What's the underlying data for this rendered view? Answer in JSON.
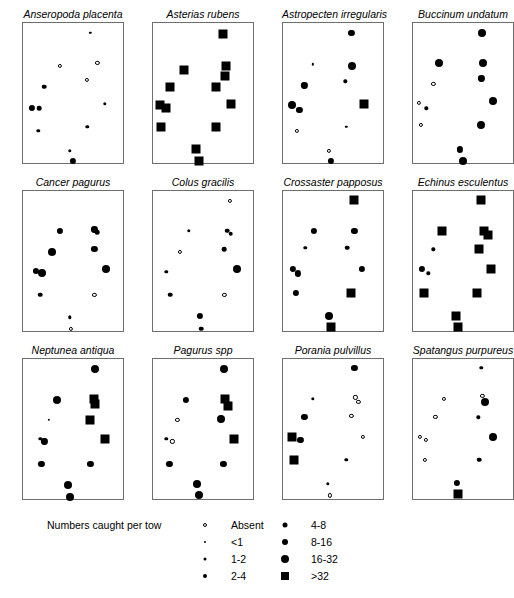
{
  "figure": {
    "island_name": "Isle of Man",
    "panel_count": 12
  },
  "legend": {
    "title": "Numbers caught per tow",
    "entries_left": [
      {
        "label": "Absent",
        "symbol": "open-circle",
        "size": 4
      },
      {
        "label": "<1",
        "symbol": "filled-circle",
        "size": 2
      },
      {
        "label": "1-2",
        "symbol": "filled-circle",
        "size": 3
      },
      {
        "label": "2-4",
        "symbol": "filled-circle",
        "size": 4
      }
    ],
    "entries_right": [
      {
        "label": "4-8",
        "symbol": "filled-circle",
        "size": 5
      },
      {
        "label": "8-16",
        "symbol": "filled-circle",
        "size": 6
      },
      {
        "label": "16-32",
        "symbol": "filled-circle",
        "size": 8
      },
      {
        "label": ">32",
        "symbol": "filled-square",
        "size": 8
      }
    ]
  },
  "chart_data": {
    "type": "scatter",
    "title": "Numbers caught per tow",
    "xlabel": "",
    "ylabel": "",
    "legend_position": "bottom",
    "grid": false,
    "note": "Twelve species distribution maps around the Isle of Man; marker size/shape encodes abundance class",
    "size_classes": [
      "Absent",
      "<1",
      "1-2",
      "2-4",
      "4-8",
      "8-16",
      "16-32",
      ">32"
    ],
    "panels": [
      {
        "title": "Anseropoda placenta",
        "row": 0,
        "col": 0,
        "points": [
          {
            "x": 0.66,
            "y": 0.07,
            "cls": "<1"
          },
          {
            "x": 0.36,
            "y": 0.3,
            "cls": "Absent"
          },
          {
            "x": 0.73,
            "y": 0.28,
            "cls": "Absent"
          },
          {
            "x": 0.63,
            "y": 0.4,
            "cls": "Absent"
          },
          {
            "x": 0.21,
            "y": 0.45,
            "cls": "2-4"
          },
          {
            "x": 0.09,
            "y": 0.6,
            "cls": "4-8"
          },
          {
            "x": 0.16,
            "y": 0.6,
            "cls": "2-4"
          },
          {
            "x": 0.8,
            "y": 0.57,
            "cls": "1-2"
          },
          {
            "x": 0.15,
            "y": 0.76,
            "cls": "1-2"
          },
          {
            "x": 0.63,
            "y": 0.73,
            "cls": "1-2"
          },
          {
            "x": 0.46,
            "y": 0.9,
            "cls": "1-2"
          },
          {
            "x": 0.49,
            "y": 0.97,
            "cls": "4-8"
          }
        ]
      },
      {
        "title": "Asterias rubens",
        "row": 0,
        "col": 1,
        "points": [
          {
            "x": 0.69,
            "y": 0.08,
            "cls": ">32"
          },
          {
            "x": 0.3,
            "y": 0.33,
            "cls": ">32"
          },
          {
            "x": 0.72,
            "y": 0.3,
            "cls": ">32"
          },
          {
            "x": 0.71,
            "y": 0.37,
            "cls": ">32"
          },
          {
            "x": 0.17,
            "y": 0.45,
            "cls": ">32"
          },
          {
            "x": 0.62,
            "y": 0.45,
            "cls": ">32"
          },
          {
            "x": 0.07,
            "y": 0.58,
            "cls": ">32"
          },
          {
            "x": 0.13,
            "y": 0.6,
            "cls": ">32"
          },
          {
            "x": 0.76,
            "y": 0.57,
            "cls": ">32"
          },
          {
            "x": 0.08,
            "y": 0.73,
            "cls": ">32"
          },
          {
            "x": 0.62,
            "y": 0.73,
            "cls": ">32"
          },
          {
            "x": 0.42,
            "y": 0.89,
            "cls": ">32"
          },
          {
            "x": 0.45,
            "y": 0.97,
            "cls": ">32"
          }
        ]
      },
      {
        "title": "Astropecten irregularis",
        "row": 0,
        "col": 2,
        "points": [
          {
            "x": 0.67,
            "y": 0.07,
            "cls": "4-8"
          },
          {
            "x": 0.29,
            "y": 0.29,
            "cls": "<1"
          },
          {
            "x": 0.68,
            "y": 0.3,
            "cls": "8-16"
          },
          {
            "x": 0.61,
            "y": 0.41,
            "cls": "1-2"
          },
          {
            "x": 0.21,
            "y": 0.44,
            "cls": "4-8"
          },
          {
            "x": 0.09,
            "y": 0.58,
            "cls": "8-16"
          },
          {
            "x": 0.16,
            "y": 0.61,
            "cls": "4-8"
          },
          {
            "x": 0.79,
            "y": 0.57,
            "cls": ">32"
          },
          {
            "x": 0.14,
            "y": 0.76,
            "cls": "Absent"
          },
          {
            "x": 0.62,
            "y": 0.73,
            "cls": "<1"
          },
          {
            "x": 0.45,
            "y": 0.9,
            "cls": "Absent"
          },
          {
            "x": 0.47,
            "y": 0.97,
            "cls": "4-8"
          }
        ]
      },
      {
        "title": "Buccinum undatum",
        "row": 0,
        "col": 3,
        "points": [
          {
            "x": 0.68,
            "y": 0.07,
            "cls": "8-16"
          },
          {
            "x": 0.25,
            "y": 0.28,
            "cls": "8-16"
          },
          {
            "x": 0.69,
            "y": 0.28,
            "cls": "8-16"
          },
          {
            "x": 0.67,
            "y": 0.39,
            "cls": "4-8"
          },
          {
            "x": 0.2,
            "y": 0.43,
            "cls": "Absent"
          },
          {
            "x": 0.06,
            "y": 0.56,
            "cls": "Absent"
          },
          {
            "x": 0.13,
            "y": 0.6,
            "cls": "1-2"
          },
          {
            "x": 0.78,
            "y": 0.55,
            "cls": "8-16"
          },
          {
            "x": 0.08,
            "y": 0.72,
            "cls": "Absent"
          },
          {
            "x": 0.67,
            "y": 0.72,
            "cls": "8-16"
          },
          {
            "x": 0.46,
            "y": 0.89,
            "cls": "4-8"
          },
          {
            "x": 0.49,
            "y": 0.97,
            "cls": "8-16"
          }
        ]
      },
      {
        "title": "Cancer pagurus",
        "row": 1,
        "col": 0,
        "points": [
          {
            "x": 0.7,
            "y": 0.27,
            "cls": "4-8"
          },
          {
            "x": 0.73,
            "y": 0.29,
            "cls": "2-4"
          },
          {
            "x": 0.36,
            "y": 0.28,
            "cls": "4-8"
          },
          {
            "x": 0.7,
            "y": 0.41,
            "cls": "4-8"
          },
          {
            "x": 0.28,
            "y": 0.43,
            "cls": "8-16"
          },
          {
            "x": 0.13,
            "y": 0.56,
            "cls": "4-8"
          },
          {
            "x": 0.19,
            "y": 0.58,
            "cls": "8-16"
          },
          {
            "x": 0.81,
            "y": 0.55,
            "cls": "8-16"
          },
          {
            "x": 0.17,
            "y": 0.73,
            "cls": "2-4"
          },
          {
            "x": 0.7,
            "y": 0.73,
            "cls": "Absent"
          },
          {
            "x": 0.46,
            "y": 0.89,
            "cls": "1-2"
          },
          {
            "x": 0.47,
            "y": 0.97,
            "cls": "Absent"
          }
        ]
      },
      {
        "title": "Colus gracilis",
        "row": 1,
        "col": 1,
        "points": [
          {
            "x": 0.75,
            "y": 0.07,
            "cls": "Absent"
          },
          {
            "x": 0.35,
            "y": 0.28,
            "cls": "1-2"
          },
          {
            "x": 0.73,
            "y": 0.28,
            "cls": "2-4"
          },
          {
            "x": 0.76,
            "y": 0.3,
            "cls": "2-4"
          },
          {
            "x": 0.7,
            "y": 0.41,
            "cls": "2-4"
          },
          {
            "x": 0.26,
            "y": 0.43,
            "cls": "Absent"
          },
          {
            "x": 0.13,
            "y": 0.57,
            "cls": "1-2"
          },
          {
            "x": 0.82,
            "y": 0.55,
            "cls": "8-16"
          },
          {
            "x": 0.17,
            "y": 0.73,
            "cls": "2-4"
          },
          {
            "x": 0.7,
            "y": 0.73,
            "cls": "Absent"
          },
          {
            "x": 0.46,
            "y": 0.88,
            "cls": "4-8"
          },
          {
            "x": 0.47,
            "y": 0.97,
            "cls": "2-4"
          }
        ]
      },
      {
        "title": "Crossaster papposus",
        "row": 1,
        "col": 2,
        "points": [
          {
            "x": 0.7,
            "y": 0.06,
            "cls": ">32"
          },
          {
            "x": 0.3,
            "y": 0.28,
            "cls": "4-8"
          },
          {
            "x": 0.7,
            "y": 0.28,
            "cls": "4-8"
          },
          {
            "x": 0.22,
            "y": 0.4,
            "cls": "1-2"
          },
          {
            "x": 0.63,
            "y": 0.4,
            "cls": "2-4"
          },
          {
            "x": 0.1,
            "y": 0.55,
            "cls": "4-8"
          },
          {
            "x": 0.15,
            "y": 0.58,
            "cls": "4-8"
          },
          {
            "x": 0.77,
            "y": 0.55,
            "cls": "4-8"
          },
          {
            "x": 0.13,
            "y": 0.72,
            "cls": "4-8"
          },
          {
            "x": 0.67,
            "y": 0.72,
            "cls": ">32"
          },
          {
            "x": 0.45,
            "y": 0.88,
            "cls": "8-16"
          },
          {
            "x": 0.47,
            "y": 0.96,
            "cls": ">32"
          }
        ]
      },
      {
        "title": "Echinus esculentus",
        "row": 1,
        "col": 3,
        "points": [
          {
            "x": 0.67,
            "y": 0.06,
            "cls": ">32"
          },
          {
            "x": 0.28,
            "y": 0.28,
            "cls": ">32"
          },
          {
            "x": 0.7,
            "y": 0.28,
            "cls": ">32"
          },
          {
            "x": 0.74,
            "y": 0.31,
            "cls": ">32"
          },
          {
            "x": 0.2,
            "y": 0.41,
            "cls": "1-2"
          },
          {
            "x": 0.65,
            "y": 0.41,
            "cls": ">32"
          },
          {
            "x": 0.09,
            "y": 0.55,
            "cls": "4-8"
          },
          {
            "x": 0.15,
            "y": 0.58,
            "cls": "1-2"
          },
          {
            "x": 0.76,
            "y": 0.55,
            "cls": ">32"
          },
          {
            "x": 0.11,
            "y": 0.72,
            "cls": ">32"
          },
          {
            "x": 0.63,
            "y": 0.72,
            "cls": ">32"
          },
          {
            "x": 0.42,
            "y": 0.88,
            "cls": ">32"
          },
          {
            "x": 0.44,
            "y": 0.96,
            "cls": ">32"
          }
        ]
      },
      {
        "title": "Neptunea antiqua",
        "row": 2,
        "col": 0,
        "points": [
          {
            "x": 0.71,
            "y": 0.07,
            "cls": "8-16"
          },
          {
            "x": 0.33,
            "y": 0.29,
            "cls": "8-16"
          },
          {
            "x": 0.7,
            "y": 0.28,
            "cls": ">32"
          },
          {
            "x": 0.71,
            "y": 0.32,
            "cls": ">32"
          },
          {
            "x": 0.66,
            "y": 0.43,
            "cls": ">32"
          },
          {
            "x": 0.25,
            "y": 0.43,
            "cls": "<1"
          },
          {
            "x": 0.17,
            "y": 0.56,
            "cls": "1-2"
          },
          {
            "x": 0.21,
            "y": 0.58,
            "cls": "4-8"
          },
          {
            "x": 0.8,
            "y": 0.56,
            "cls": ">32"
          },
          {
            "x": 0.18,
            "y": 0.74,
            "cls": "4-8"
          },
          {
            "x": 0.66,
            "y": 0.74,
            "cls": "4-8"
          },
          {
            "x": 0.44,
            "y": 0.89,
            "cls": "8-16"
          },
          {
            "x": 0.46,
            "y": 0.97,
            "cls": "8-16"
          }
        ]
      },
      {
        "title": "Pagurus spp",
        "row": 2,
        "col": 1,
        "points": [
          {
            "x": 0.7,
            "y": 0.07,
            "cls": "8-16"
          },
          {
            "x": 0.32,
            "y": 0.29,
            "cls": "4-8"
          },
          {
            "x": 0.71,
            "y": 0.28,
            "cls": ">32"
          },
          {
            "x": 0.74,
            "y": 0.33,
            "cls": ">32"
          },
          {
            "x": 0.67,
            "y": 0.42,
            "cls": "8-16"
          },
          {
            "x": 0.24,
            "y": 0.43,
            "cls": "Absent"
          },
          {
            "x": 0.13,
            "y": 0.56,
            "cls": "1-2"
          },
          {
            "x": 0.19,
            "y": 0.58,
            "cls": "Absent"
          },
          {
            "x": 0.79,
            "y": 0.56,
            "cls": ">32"
          },
          {
            "x": 0.16,
            "y": 0.74,
            "cls": "4-8"
          },
          {
            "x": 0.69,
            "y": 0.74,
            "cls": "4-8"
          },
          {
            "x": 0.43,
            "y": 0.88,
            "cls": "8-16"
          },
          {
            "x": 0.45,
            "y": 0.96,
            "cls": "8-16"
          }
        ]
      },
      {
        "title": "Porania pulvillus",
        "row": 2,
        "col": 2,
        "points": [
          {
            "x": 0.7,
            "y": 0.06,
            "cls": "4-8"
          },
          {
            "x": 0.29,
            "y": 0.28,
            "cls": "1-2"
          },
          {
            "x": 0.71,
            "y": 0.27,
            "cls": "Absent"
          },
          {
            "x": 0.74,
            "y": 0.3,
            "cls": "Absent"
          },
          {
            "x": 0.67,
            "y": 0.4,
            "cls": "Absent"
          },
          {
            "x": 0.21,
            "y": 0.41,
            "cls": "4-8"
          },
          {
            "x": 0.09,
            "y": 0.55,
            "cls": ">32"
          },
          {
            "x": 0.17,
            "y": 0.57,
            "cls": "4-8"
          },
          {
            "x": 0.78,
            "y": 0.55,
            "cls": "Absent"
          },
          {
            "x": 0.11,
            "y": 0.71,
            "cls": ">32"
          },
          {
            "x": 0.62,
            "y": 0.71,
            "cls": "1-2"
          },
          {
            "x": 0.44,
            "y": 0.88,
            "cls": "1-2"
          },
          {
            "x": 0.46,
            "y": 0.96,
            "cls": "Absent"
          }
        ]
      },
      {
        "title": "Spatangus purpureus",
        "row": 2,
        "col": 3,
        "points": [
          {
            "x": 0.67,
            "y": 0.06,
            "cls": "1-2"
          },
          {
            "x": 0.3,
            "y": 0.28,
            "cls": "Absent"
          },
          {
            "x": 0.68,
            "y": 0.26,
            "cls": "Absent"
          },
          {
            "x": 0.71,
            "y": 0.3,
            "cls": "8-16"
          },
          {
            "x": 0.64,
            "y": 0.41,
            "cls": "1-2"
          },
          {
            "x": 0.22,
            "y": 0.41,
            "cls": "Absent"
          },
          {
            "x": 0.07,
            "y": 0.55,
            "cls": "Absent"
          },
          {
            "x": 0.13,
            "y": 0.57,
            "cls": "Absent"
          },
          {
            "x": 0.78,
            "y": 0.55,
            "cls": "8-16"
          },
          {
            "x": 0.12,
            "y": 0.71,
            "cls": "Absent"
          },
          {
            "x": 0.65,
            "y": 0.71,
            "cls": "2-4"
          },
          {
            "x": 0.43,
            "y": 0.87,
            "cls": "4-8"
          },
          {
            "x": 0.44,
            "y": 0.95,
            "cls": ">32"
          }
        ]
      }
    ]
  }
}
